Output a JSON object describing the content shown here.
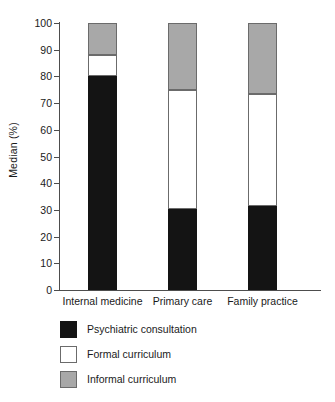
{
  "chart_data": {
    "type": "bar",
    "subtype": "stacked-bar",
    "title": "",
    "subtitle": "",
    "xlabel": "",
    "ylabel": "Median (%)",
    "ylim": [
      0,
      100
    ],
    "ytick_values": [
      0,
      10,
      20,
      30,
      40,
      50,
      60,
      70,
      80,
      90,
      100
    ],
    "ytick_labels": [
      "0",
      "10",
      "20",
      "30",
      "40",
      "50",
      "60",
      "70",
      "80",
      "90",
      "100"
    ],
    "grid": false,
    "legend_position": "below-axes-left",
    "categories": [
      "Internal medicine",
      "Primary care",
      "Family practice"
    ],
    "series": [
      {
        "name": "Psychiatric consultation",
        "color": "#141414",
        "values": [
          80,
          30.5,
          31.5
        ]
      },
      {
        "name": "Formal curriculum",
        "color": "#ffffff",
        "values": [
          8,
          44.5,
          42
        ]
      },
      {
        "name": "Informal curriculum",
        "color": "#a8a8a8",
        "values": [
          12,
          25,
          26.5
        ]
      }
    ],
    "cumulative_tops": [
      [
        80,
        88,
        100
      ],
      [
        30.5,
        75,
        100
      ],
      [
        31.5,
        73.5,
        100
      ]
    ],
    "annotations": []
  },
  "colors": {
    "axis": "#4d4d4d",
    "text": "#1a1a1a",
    "background": "#ffffff",
    "segment_edge": "#6b6b6b",
    "black_series": "#141414",
    "white_series": "#ffffff",
    "gray_series": "#a8a8a8"
  }
}
